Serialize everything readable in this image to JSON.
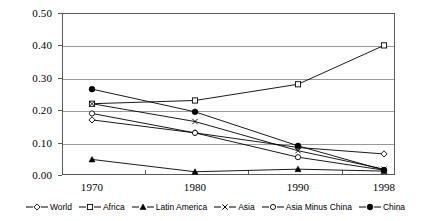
{
  "chart_data": {
    "type": "line",
    "title": "",
    "xlabel": "",
    "ylabel": "",
    "x": [
      1970,
      1980,
      1990,
      1998
    ],
    "xticklabels": [
      "1970",
      "1980",
      "1990",
      "1998"
    ],
    "yticks": [
      0.0,
      0.1,
      0.2,
      0.3,
      0.4,
      0.5
    ],
    "yticklabels": [
      "0.00",
      "0.10",
      "0.20",
      "0.30",
      "0.40",
      "0.50"
    ],
    "ylim": [
      0.0,
      0.5
    ],
    "grid": "horizontal",
    "legend_position": "bottom",
    "series": [
      {
        "name": "World",
        "marker": "open-diamond",
        "values": [
          0.17,
          0.13,
          0.085,
          0.065
        ]
      },
      {
        "name": "Africa",
        "marker": "open-square",
        "values": [
          0.22,
          0.23,
          0.28,
          0.4
        ]
      },
      {
        "name": "Latin America",
        "marker": "filled-triangle",
        "values": [
          0.048,
          0.01,
          0.018,
          0.012
        ]
      },
      {
        "name": "Asia",
        "marker": "cross",
        "values": [
          0.22,
          0.165,
          0.075,
          0.018
        ]
      },
      {
        "name": "Asia Minus China",
        "marker": "open-circle",
        "values": [
          0.19,
          0.13,
          0.055,
          0.015
        ]
      },
      {
        "name": "China",
        "marker": "filled-circle",
        "values": [
          0.265,
          0.195,
          0.09,
          0.015
        ]
      }
    ]
  },
  "colors": {
    "line": "#000000",
    "grid": "#9a9a9a",
    "frame": "#5a5a5a",
    "background": "#ffffff"
  }
}
